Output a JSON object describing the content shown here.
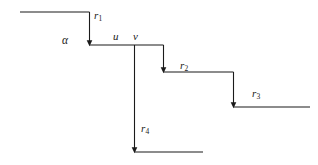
{
  "figure": {
    "width": 318,
    "height": 165,
    "background_color": "#ffffff",
    "stroke_color": "#1a1a1a",
    "stroke_width": 1.1
  },
  "labels": {
    "r1": {
      "text": "r",
      "sub": "1",
      "x": 94,
      "y": 10
    },
    "alpha": {
      "text": "α",
      "x": 62,
      "y": 35
    },
    "u": {
      "text": "u",
      "x": 113,
      "y": 31
    },
    "v": {
      "text": "v",
      "x": 133,
      "y": 31
    },
    "r2": {
      "text": "r",
      "sub": "2",
      "x": 180,
      "y": 60
    },
    "r3": {
      "text": "r",
      "sub": "3",
      "x": 252,
      "y": 88
    },
    "r4": {
      "text": "r",
      "sub": "4",
      "x": 141,
      "y": 123
    }
  },
  "geometry": {
    "segments": [
      {
        "name": "top-horizontal-r1",
        "x1": 20,
        "y1": 12,
        "x2": 89.5,
        "y2": 12
      },
      {
        "name": "vertical-r1-drop",
        "x1": 89.5,
        "y1": 12,
        "x2": 89.5,
        "y2": 44
      },
      {
        "name": "horizontal-level-2",
        "x1": 89.5,
        "y1": 45,
        "x2": 163.5,
        "y2": 45
      },
      {
        "name": "vertical-r2-drop",
        "x1": 163.5,
        "y1": 45,
        "x2": 163.5,
        "y2": 71
      },
      {
        "name": "horizontal-level-3",
        "x1": 163.5,
        "y1": 72,
        "x2": 233.5,
        "y2": 72
      },
      {
        "name": "vertical-r3-drop",
        "x1": 233.5,
        "y1": 72,
        "x2": 233.5,
        "y2": 106
      },
      {
        "name": "horizontal-level-4",
        "x1": 233.5,
        "y1": 107,
        "x2": 310,
        "y2": 107
      },
      {
        "name": "vertical-r4-drop",
        "x1": 134.5,
        "y1": 45,
        "x2": 134.5,
        "y2": 151
      },
      {
        "name": "horizontal-bottom",
        "x1": 134.5,
        "y1": 152,
        "x2": 203,
        "y2": 152
      }
    ],
    "arrowheads": [
      {
        "name": "arrowhead-r1",
        "x": 89.5,
        "y": 45
      },
      {
        "name": "arrowhead-r2",
        "x": 163.5,
        "y": 72
      },
      {
        "name": "arrowhead-r3",
        "x": 233.5,
        "y": 107
      },
      {
        "name": "arrowhead-r4",
        "x": 134.5,
        "y": 152
      }
    ]
  }
}
